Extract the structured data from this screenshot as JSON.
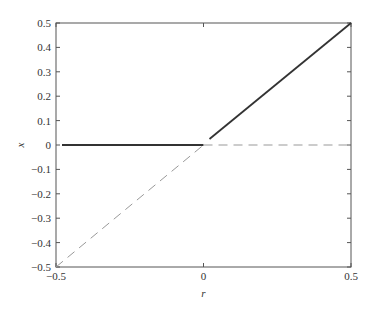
{
  "chart_data": {
    "type": "line",
    "title": "",
    "xlabel": "r",
    "ylabel": "x",
    "xlim": [
      -0.5,
      0.5
    ],
    "ylim": [
      -0.5,
      0.5
    ],
    "x_ticks": [
      "-0.5",
      "0",
      "0.5"
    ],
    "y_ticks": [
      "0.5",
      "0.4",
      "0.3",
      "0.2",
      "0.1",
      "0",
      "-0.1",
      "-0.2",
      "-0.3",
      "-0.4",
      "-0.5"
    ],
    "grid": false,
    "legend": null,
    "series": [
      {
        "name": "stable x=0 (r<0)",
        "style": "solid",
        "x": [
          -0.5,
          0.0
        ],
        "y": [
          0.0,
          0.0
        ]
      },
      {
        "name": "stable x=r (r>0)",
        "style": "solid",
        "x": [
          0.0,
          0.5
        ],
        "y": [
          0.0,
          0.5
        ]
      },
      {
        "name": "unstable x=r (r<0)",
        "style": "dashed",
        "x": [
          -0.5,
          0.0
        ],
        "y": [
          -0.5,
          0.0
        ]
      },
      {
        "name": "unstable x=0 (r>0)",
        "style": "dashed",
        "x": [
          0.0,
          0.5
        ],
        "y": [
          0.0,
          0.0
        ]
      }
    ]
  }
}
